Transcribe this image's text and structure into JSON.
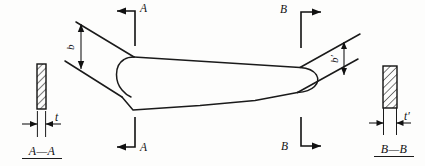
{
  "diagram": {
    "colors": {
      "outline": "#1a1a1a",
      "dimension": "#111111",
      "hatch": "#111111",
      "background": "#fdfdfc"
    },
    "section_marks": {
      "top_left": {
        "label": "A",
        "direction": "left"
      },
      "bottom_left": {
        "label": "A",
        "direction": "left"
      },
      "top_right": {
        "label": "B",
        "direction": "right"
      },
      "bottom_right": {
        "label": "B",
        "direction": "right"
      }
    },
    "dimensions": {
      "chord_root": {
        "label": "b",
        "orientation": "vertical",
        "side": "left"
      },
      "chord_tip": {
        "label": "b′",
        "orientation": "vertical",
        "side": "right"
      },
      "thickness_root": {
        "label": "t",
        "orientation": "horizontal",
        "side": "left"
      },
      "thickness_tip": {
        "label": "t′",
        "orientation": "horizontal",
        "side": "right"
      }
    },
    "sections": {
      "left": {
        "caption": "A—A",
        "hatch_pattern": "diagonal-45",
        "profile": "thin-rectangle"
      },
      "right": {
        "caption": "B—B",
        "hatch_pattern": "diagonal-45",
        "profile": "thick-rectangle"
      }
    }
  }
}
